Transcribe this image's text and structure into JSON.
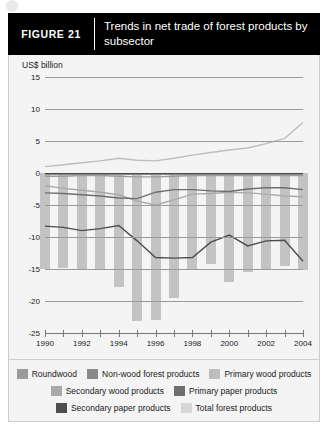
{
  "figure": {
    "tag": "FIGURE  21",
    "title": "Trends in net trade of forest products by subsector"
  },
  "chart_data": {
    "type": "bar",
    "title": "Trends in net trade of forest products by subsector",
    "xlabel": "",
    "ylabel": "US$ billion",
    "ylim": [
      -25,
      15
    ],
    "xlim": [
      1990,
      2004
    ],
    "grid": true,
    "legend_position": "bottom",
    "yticks": [
      15,
      10,
      5,
      0,
      -5,
      -10,
      -15,
      -20,
      -25
    ],
    "xticks": [
      1990,
      1991,
      1992,
      1993,
      1994,
      1995,
      1996,
      1997,
      1998,
      1999,
      2000,
      2001,
      2002,
      2003,
      2004
    ],
    "xtick_labels": [
      "1990",
      "",
      "1992",
      "",
      "1994",
      "",
      "1996",
      "",
      "1998",
      "",
      "2000",
      "",
      "2002",
      "",
      "2004"
    ],
    "x": [
      1990,
      1991,
      1992,
      1993,
      1994,
      1995,
      1996,
      1997,
      1998,
      1999,
      2000,
      2001,
      2002,
      2003,
      2004
    ],
    "bar_series": {
      "name": "Total forest products",
      "color": "#c3c3c3",
      "values": [
        -15.0,
        -14.8,
        -15.0,
        -15.0,
        -17.8,
        -23.2,
        -23.0,
        -19.5,
        -15.0,
        -14.2,
        -17.0,
        -15.5,
        -15.2,
        -14.6,
        -15.2
      ]
    },
    "series": [
      {
        "name": "Roundwood",
        "color": "#9b9b9b",
        "values": [
          -0.5,
          -0.5,
          -0.4,
          -0.4,
          -0.5,
          -0.6,
          -0.6,
          -0.5,
          -0.4,
          -0.4,
          -0.4,
          -0.4,
          -0.4,
          -0.4,
          -0.4
        ]
      },
      {
        "name": "Non-wood forest products",
        "color": "#8a8a8a",
        "values": [
          -0.2,
          -0.2,
          -0.2,
          -0.2,
          -0.2,
          -0.2,
          -0.2,
          -0.2,
          -0.2,
          -0.2,
          -0.2,
          -0.2,
          -0.2,
          -0.2,
          -0.2
        ]
      },
      {
        "name": "Primary wood products",
        "color": "#bdbdbd",
        "values": [
          1.0,
          1.3,
          1.6,
          1.9,
          2.3,
          2.0,
          1.9,
          2.3,
          2.8,
          3.2,
          3.6,
          3.9,
          4.6,
          5.4,
          7.9
        ]
      },
      {
        "name": "Secondary wood products",
        "color": "#a9a9a9",
        "values": [
          -2.0,
          -2.4,
          -2.7,
          -3.0,
          -3.4,
          -4.4,
          -5.0,
          -4.2,
          -3.3,
          -3.2,
          -3.0,
          -3.1,
          -3.3,
          -3.6,
          -3.7
        ]
      },
      {
        "name": "Primary paper products",
        "color": "#6e6e6e",
        "values": [
          -3.1,
          -3.2,
          -3.4,
          -3.6,
          -3.9,
          -4.0,
          -3.0,
          -2.6,
          -2.6,
          -2.8,
          -2.9,
          -2.5,
          -2.3,
          -2.3,
          -2.6
        ]
      },
      {
        "name": "Secondary paper products",
        "color": "#4d4d4d",
        "values": [
          -8.3,
          -8.5,
          -9.0,
          -8.7,
          -8.2,
          -10.6,
          -13.2,
          -13.3,
          -13.2,
          -10.8,
          -9.7,
          -11.4,
          -10.6,
          -10.5,
          -13.8
        ]
      }
    ],
    "legend_entries": [
      {
        "label": "Roundwood",
        "color": "#9b9b9b"
      },
      {
        "label": "Non-wood forest products",
        "color": "#8a8a8a"
      },
      {
        "label": "Primary wood products",
        "color": "#bdbdbd"
      },
      {
        "label": "Secondary wood products",
        "color": "#a9a9a9"
      },
      {
        "label": "Primary paper products",
        "color": "#6e6e6e"
      },
      {
        "label": "Secondary paper products",
        "color": "#4d4d4d"
      },
      {
        "label": "Total forest products",
        "color": "#d7d7d7"
      }
    ]
  }
}
